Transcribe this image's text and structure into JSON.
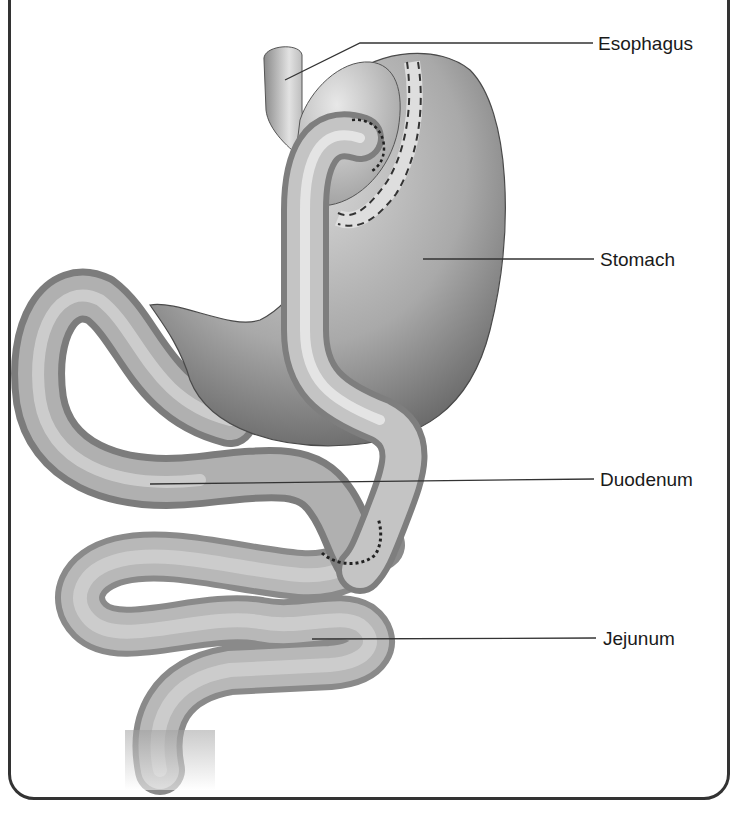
{
  "figure": {
    "labels": [
      {
        "id": "esophagus",
        "text": "Esophagus"
      },
      {
        "id": "stomach",
        "text": "Stomach"
      },
      {
        "id": "duodenum",
        "text": "Duodenum"
      },
      {
        "id": "jejunum",
        "text": "Jejunum"
      }
    ]
  },
  "colors": {
    "frame": "#333333",
    "leader_line": "#333333",
    "text": "#1a1a1a",
    "tissue_light": "#e6e6e6",
    "tissue_mid": "#a8a8a8",
    "tissue_dark": "#5e5e5e"
  }
}
